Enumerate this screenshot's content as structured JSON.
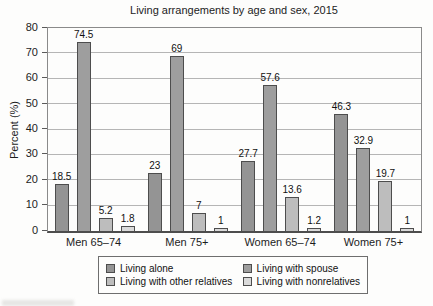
{
  "chart_data": {
    "type": "bar",
    "title": "Living arrangements by age and sex, 2015",
    "xlabel": "",
    "ylabel": "Percent (%)",
    "ylim": [
      0,
      80
    ],
    "yticks": [
      0,
      10,
      20,
      30,
      40,
      50,
      60,
      70,
      80
    ],
    "grid": true,
    "legend_position": "bottom",
    "categories": [
      "Men 65–74",
      "Men 75+",
      "Women 65–74",
      "Women 75+"
    ],
    "series": [
      {
        "name": "Living alone",
        "color": "#949494",
        "values": [
          18.5,
          23,
          27.7,
          46.3
        ]
      },
      {
        "name": "Living with spouse",
        "color": "#9e9e9e",
        "values": [
          74.5,
          69,
          57.6,
          32.9
        ]
      },
      {
        "name": "Living with other relatives",
        "color": "#bdbdbd",
        "values": [
          5.2,
          7,
          13.6,
          19.7
        ]
      },
      {
        "name": "Living with nonrelatives",
        "color": "#dadada",
        "values": [
          1.8,
          1,
          1.2,
          1
        ]
      }
    ]
  }
}
